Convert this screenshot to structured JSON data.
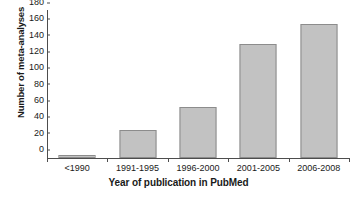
{
  "chart_data": {
    "type": "bar",
    "title": "",
    "xlabel": "Year of publication in PubMed",
    "ylabel": "Number of meta-analyses",
    "categories": [
      "<1990",
      "1991-1995",
      "1996-2000",
      "2001-2005",
      "2006-2008"
    ],
    "values": [
      4,
      34,
      63,
      139,
      164
    ],
    "series": [
      {
        "name": "Number of meta-analyses",
        "values": [
          4,
          34,
          63,
          139,
          164
        ]
      }
    ],
    "ylim": [
      0,
      180
    ],
    "ytick_labels": [
      "0",
      "20",
      "40",
      "60",
      "80",
      "100",
      "120",
      "140",
      "160",
      "180"
    ],
    "ytick_values": [
      0,
      20,
      40,
      60,
      80,
      100,
      120,
      140,
      160,
      180
    ],
    "ytick_interval": 20,
    "grid": false,
    "legend": false,
    "legend_position": "none",
    "bar_fill_color": "#c2c2c2",
    "bar_border_color": "#8c8c8c",
    "axis_color": "#4d4d4d",
    "background_color": "#ffffff",
    "orientation": "vertical"
  }
}
